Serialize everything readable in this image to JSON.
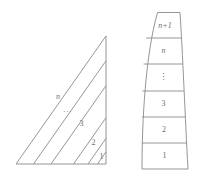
{
  "figure": {
    "left_figure": {
      "name": "subdivided-right-triangle",
      "labels": {
        "strip_1": "1",
        "strip_2": "2",
        "strip_3": "3",
        "strip_ellipsis": "···",
        "strip_n": "n"
      }
    },
    "right_figure": {
      "name": "stacked-curved-column",
      "labels": {
        "band_1": "1",
        "band_2": "2",
        "band_3": "3",
        "band_ellipsis": "⋮",
        "band_n": "n",
        "band_n_plus_1": "n+1"
      }
    },
    "style": {
      "stroke_color": "#8a8a8a",
      "label_color": "#6f6f6f",
      "background": "#ffffff"
    }
  }
}
